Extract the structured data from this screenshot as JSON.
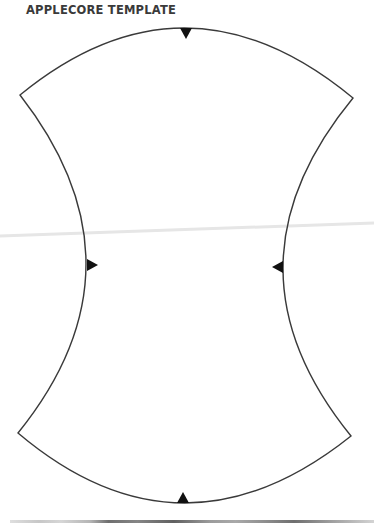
{
  "document": {
    "title": "APPLECORE TEMPLATE"
  },
  "template": {
    "shape": "applecore",
    "stroke_color": "#3a3a3a",
    "marker_color": "#111111",
    "corners": {
      "top_left": [
        20,
        95
      ],
      "top_right": [
        353,
        98
      ],
      "bottom_left": [
        18,
        433
      ],
      "bottom_right": [
        351,
        436
      ]
    },
    "markers": [
      {
        "position": "top",
        "direction": "down"
      },
      {
        "position": "left",
        "direction": "right"
      },
      {
        "position": "right",
        "direction": "left"
      },
      {
        "position": "bottom",
        "direction": "up"
      }
    ]
  }
}
